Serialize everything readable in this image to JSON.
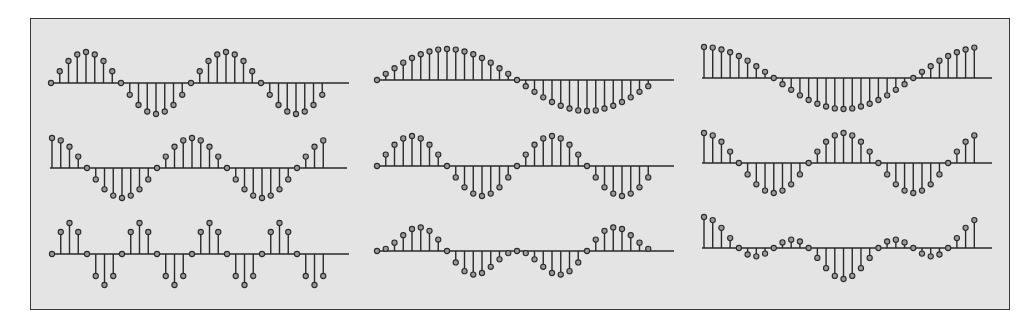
{
  "chart_data": [
    {
      "type": "stem",
      "title": "",
      "xlabel": "",
      "ylabel": "",
      "position": "row 1, col 1",
      "description": "sin(2*pi*n/16)",
      "x": [
        0,
        1,
        2,
        3,
        4,
        5,
        6,
        7,
        8,
        9,
        10,
        11,
        12,
        13,
        14,
        15,
        16,
        17,
        18,
        19,
        20,
        21,
        22,
        23,
        24,
        25,
        26,
        27,
        28,
        29,
        30,
        31
      ],
      "values": [
        0,
        0.38,
        0.71,
        0.92,
        1,
        0.92,
        0.71,
        0.38,
        0,
        -0.38,
        -0.71,
        -0.92,
        -1,
        -0.92,
        -0.71,
        -0.38,
        0,
        0.38,
        0.71,
        0.92,
        1,
        0.92,
        0.71,
        0.38,
        0,
        -0.38,
        -0.71,
        -0.92,
        -1,
        -0.92,
        -0.71,
        -0.38
      ],
      "ylim": [
        -1,
        1
      ],
      "layout": {
        "x0": 51,
        "axis_y": 83,
        "dx": 8.75,
        "amp": 31,
        "axis_end": 349
      }
    },
    {
      "type": "stem",
      "title": "",
      "xlabel": "",
      "ylabel": "",
      "position": "row 1, col 2",
      "description": "sin(2*pi*n/32)",
      "x": [
        0,
        1,
        2,
        3,
        4,
        5,
        6,
        7,
        8,
        9,
        10,
        11,
        12,
        13,
        14,
        15,
        16,
        17,
        18,
        19,
        20,
        21,
        22,
        23,
        24,
        25,
        26,
        27,
        28,
        29,
        30,
        31
      ],
      "values": [
        0,
        0.2,
        0.38,
        0.56,
        0.71,
        0.83,
        0.92,
        0.98,
        1,
        0.98,
        0.92,
        0.83,
        0.71,
        0.56,
        0.38,
        0.2,
        0,
        -0.2,
        -0.38,
        -0.56,
        -0.71,
        -0.83,
        -0.92,
        -0.98,
        -1,
        -0.98,
        -0.92,
        -0.83,
        -0.71,
        -0.56,
        -0.38,
        -0.2
      ],
      "ylim": [
        -1,
        1
      ],
      "layout": {
        "x0": 377,
        "axis_y": 80,
        "dx": 8.75,
        "amp": 31,
        "axis_end": 674
      }
    },
    {
      "type": "stem",
      "title": "",
      "xlabel": "",
      "ylabel": "",
      "position": "row 1, col 3",
      "description": "cos(2*pi*n/32)",
      "x": [
        0,
        1,
        2,
        3,
        4,
        5,
        6,
        7,
        8,
        9,
        10,
        11,
        12,
        13,
        14,
        15,
        16,
        17,
        18,
        19,
        20,
        21,
        22,
        23,
        24,
        25,
        26,
        27,
        28,
        29,
        30,
        31
      ],
      "values": [
        1,
        0.98,
        0.92,
        0.83,
        0.71,
        0.56,
        0.38,
        0.2,
        0,
        -0.2,
        -0.38,
        -0.56,
        -0.71,
        -0.83,
        -0.92,
        -0.98,
        -1,
        -0.98,
        -0.92,
        -0.83,
        -0.71,
        -0.56,
        -0.38,
        -0.2,
        0,
        0.2,
        0.38,
        0.56,
        0.71,
        0.83,
        0.92,
        0.98
      ],
      "ylim": [
        -1,
        1
      ],
      "layout": {
        "x0": 704,
        "axis_y": 78,
        "dx": 8.72,
        "amp": 31,
        "axis_end": 992
      }
    },
    {
      "type": "stem",
      "title": "",
      "xlabel": "",
      "ylabel": "",
      "position": "row 2, col 1",
      "description": "cos(2*pi*n/16)",
      "x": [
        0,
        1,
        2,
        3,
        4,
        5,
        6,
        7,
        8,
        9,
        10,
        11,
        12,
        13,
        14,
        15,
        16,
        17,
        18,
        19,
        20,
        21,
        22,
        23,
        24,
        25,
        26,
        27,
        28,
        29,
        30,
        31
      ],
      "values": [
        1,
        0.92,
        0.71,
        0.38,
        0,
        -0.38,
        -0.71,
        -0.92,
        -1,
        -0.92,
        -0.71,
        -0.38,
        0,
        0.38,
        0.71,
        0.92,
        1,
        0.92,
        0.71,
        0.38,
        0,
        -0.38,
        -0.71,
        -0.92,
        -1,
        -0.92,
        -0.71,
        -0.38,
        0,
        0.38,
        0.71,
        0.92
      ],
      "ylim": [
        -1,
        1
      ],
      "layout": {
        "x0": 52,
        "axis_y": 168,
        "dx": 8.75,
        "amp": 30,
        "axis_end": 347
      }
    },
    {
      "type": "stem",
      "title": "",
      "xlabel": "",
      "ylabel": "",
      "position": "row 2, col 2",
      "description": "sin(2*pi*n/16)",
      "x": [
        0,
        1,
        2,
        3,
        4,
        5,
        6,
        7,
        8,
        9,
        10,
        11,
        12,
        13,
        14,
        15,
        16,
        17,
        18,
        19,
        20,
        21,
        22,
        23,
        24,
        25,
        26,
        27,
        28,
        29,
        30,
        31
      ],
      "values": [
        0,
        0.38,
        0.71,
        0.92,
        1,
        0.92,
        0.71,
        0.38,
        0,
        -0.38,
        -0.71,
        -0.92,
        -1,
        -0.92,
        -0.71,
        -0.38,
        0,
        0.38,
        0.71,
        0.92,
        1,
        0.92,
        0.71,
        0.38,
        0,
        -0.38,
        -0.71,
        -0.92,
        -1,
        -0.92,
        -0.71,
        -0.38
      ],
      "ylim": [
        -1,
        1
      ],
      "layout": {
        "x0": 377,
        "axis_y": 166,
        "dx": 8.75,
        "amp": 30,
        "axis_end": 674
      }
    },
    {
      "type": "stem",
      "title": "",
      "xlabel": "",
      "ylabel": "",
      "position": "row 2, col 3",
      "description": "cos(2*pi*n/16)",
      "x": [
        0,
        1,
        2,
        3,
        4,
        5,
        6,
        7,
        8,
        9,
        10,
        11,
        12,
        13,
        14,
        15,
        16,
        17,
        18,
        19,
        20,
        21,
        22,
        23,
        24,
        25,
        26,
        27,
        28,
        29,
        30,
        31
      ],
      "values": [
        1,
        0.92,
        0.71,
        0.38,
        0,
        -0.38,
        -0.71,
        -0.92,
        -1,
        -0.92,
        -0.71,
        -0.38,
        0,
        0.38,
        0.71,
        0.92,
        1,
        0.92,
        0.71,
        0.38,
        0,
        -0.38,
        -0.71,
        -0.92,
        -1,
        -0.92,
        -0.71,
        -0.38,
        0,
        0.38,
        0.71,
        0.92
      ],
      "ylim": [
        -1,
        1
      ],
      "layout": {
        "x0": 704,
        "axis_y": 163,
        "dx": 8.72,
        "amp": 30,
        "axis_end": 992
      }
    },
    {
      "type": "stem",
      "title": "",
      "xlabel": "",
      "ylabel": "",
      "position": "row 3, col 1",
      "description": "sin(2*pi*n/8)",
      "x": [
        0,
        1,
        2,
        3,
        4,
        5,
        6,
        7,
        8,
        9,
        10,
        11,
        12,
        13,
        14,
        15,
        16,
        17,
        18,
        19,
        20,
        21,
        22,
        23,
        24,
        25,
        26,
        27,
        28,
        29,
        30,
        31
      ],
      "values": [
        0,
        0.71,
        1,
        0.71,
        0,
        -0.71,
        -1,
        -0.71,
        0,
        0.71,
        1,
        0.71,
        0,
        -0.71,
        -1,
        -0.71,
        0,
        0.71,
        1,
        0.71,
        0,
        -0.71,
        -1,
        -0.71,
        0,
        0.71,
        1,
        0.71,
        0,
        -0.71,
        -1,
        -0.71
      ],
      "ylim": [
        -1,
        1
      ],
      "layout": {
        "x0": 52,
        "axis_y": 254,
        "dx": 8.75,
        "amp": 31,
        "axis_end": 349
      }
    },
    {
      "type": "stem",
      "title": "",
      "xlabel": "",
      "ylabel": "",
      "position": "row 3, col 2",
      "description": "sin(2*pi*n/16) * sin(2*pi*n/32)",
      "x": [
        0,
        1,
        2,
        3,
        4,
        5,
        6,
        7,
        8,
        9,
        10,
        11,
        12,
        13,
        14,
        15,
        16,
        17,
        18,
        19,
        20,
        21,
        22,
        23,
        24,
        25,
        26,
        27,
        28,
        29,
        30,
        31
      ],
      "values": [
        0,
        0.07,
        0.27,
        0.51,
        0.71,
        0.76,
        0.65,
        0.37,
        0,
        -0.37,
        -0.65,
        -0.76,
        -0.71,
        -0.51,
        -0.27,
        -0.07,
        0,
        -0.07,
        -0.27,
        -0.51,
        -0.71,
        -0.76,
        -0.65,
        -0.37,
        0,
        0.37,
        0.65,
        0.76,
        0.71,
        0.51,
        0.27,
        0.07
      ],
      "ylim": [
        -1,
        1
      ],
      "layout": {
        "x0": 377,
        "axis_y": 251,
        "dx": 8.75,
        "amp": 31,
        "axis_end": 674
      }
    },
    {
      "type": "stem",
      "title": "",
      "xlabel": "",
      "ylabel": "",
      "position": "row 3, col 3",
      "description": "cos(2*pi*n/16) * cos(2*pi*n/32)",
      "x": [
        0,
        1,
        2,
        3,
        4,
        5,
        6,
        7,
        8,
        9,
        10,
        11,
        12,
        13,
        14,
        15,
        16,
        17,
        18,
        19,
        20,
        21,
        22,
        23,
        24,
        25,
        26,
        27,
        28,
        29,
        30,
        31
      ],
      "values": [
        1,
        0.9,
        0.65,
        0.32,
        0,
        -0.21,
        -0.27,
        -0.18,
        0,
        0.18,
        0.27,
        0.21,
        0,
        -0.32,
        -0.65,
        -0.9,
        -1,
        -0.9,
        -0.65,
        -0.32,
        0,
        0.21,
        0.27,
        0.18,
        0,
        -0.18,
        -0.27,
        -0.21,
        0,
        0.32,
        0.65,
        0.9
      ],
      "ylim": [
        -1,
        1
      ],
      "layout": {
        "x0": 704,
        "axis_y": 248,
        "dx": 8.72,
        "amp": 31,
        "axis_end": 992
      }
    }
  ],
  "colors": {
    "frame_background": "#e4e4e4",
    "frame_border": "#3a3a3a",
    "stem": "#2a2a2a",
    "marker_fill": "#9a9a9a"
  }
}
